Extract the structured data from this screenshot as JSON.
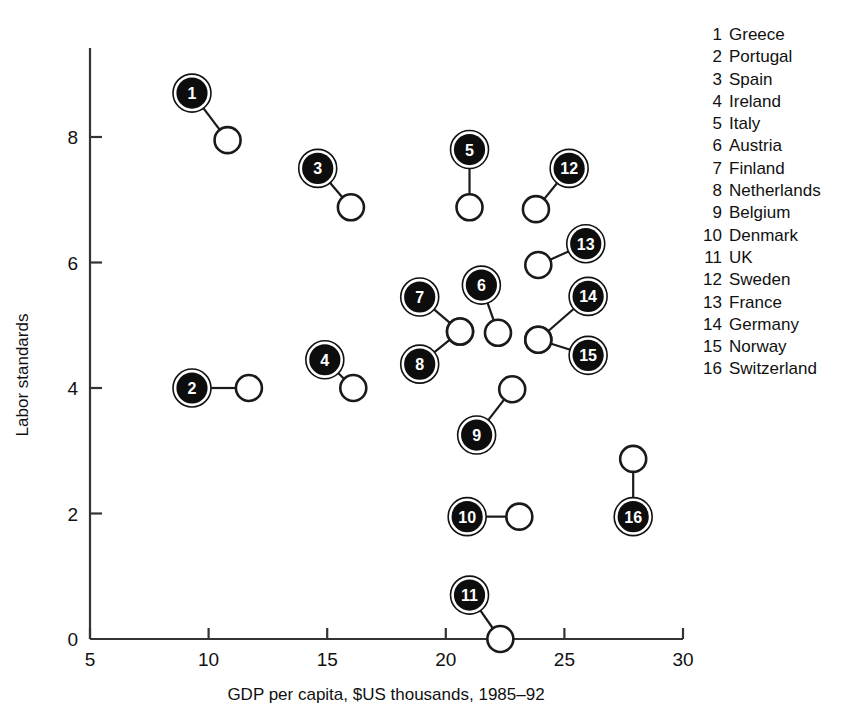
{
  "chart_data": {
    "type": "scatter",
    "title": "",
    "xlabel": "GDP per capita, $US thousands, 1985–92",
    "ylabel": "Labor standards",
    "xlim": [
      5,
      30
    ],
    "ylim": [
      0,
      9.4
    ],
    "xticks": [
      "5",
      "10",
      "15",
      "20",
      "25",
      "30"
    ],
    "yticks": [
      "0",
      "2",
      "4",
      "6",
      "8"
    ],
    "grid": false,
    "legend_position": "right",
    "marker_description": "filled numbered circle = first period value, open circle = second period value, joined by a line",
    "points": [
      {
        "id": 1,
        "label": "Greece",
        "x": 9.3,
        "y": 8.7,
        "x2": 10.8,
        "y2": 7.95
      },
      {
        "id": 2,
        "label": "Portugal",
        "x": 9.3,
        "y": 4.0,
        "x2": 11.7,
        "y2": 4.0
      },
      {
        "id": 3,
        "label": "Spain",
        "x": 14.6,
        "y": 7.5,
        "x2": 16.0,
        "y2": 6.88
      },
      {
        "id": 4,
        "label": "Ireland",
        "x": 14.9,
        "y": 4.45,
        "x2": 16.1,
        "y2": 4.0
      },
      {
        "id": 5,
        "label": "Italy",
        "x": 21.0,
        "y": 7.8,
        "x2": 21.0,
        "y2": 6.88
      },
      {
        "id": 6,
        "label": "Austria",
        "x": 21.5,
        "y": 5.64,
        "x2": 22.2,
        "y2": 4.88
      },
      {
        "id": 7,
        "label": "Finland",
        "x": 18.9,
        "y": 5.45,
        "x2": 20.6,
        "y2": 4.9
      },
      {
        "id": 8,
        "label": "Netherlands",
        "x": 18.9,
        "y": 4.38,
        "x2": 20.6,
        "y2": 4.9
      },
      {
        "id": 9,
        "label": "Belgium",
        "x": 21.3,
        "y": 3.25,
        "x2": 22.8,
        "y2": 3.98
      },
      {
        "id": 10,
        "label": "Denmark",
        "x": 20.9,
        "y": 1.95,
        "x2": 23.1,
        "y2": 1.95
      },
      {
        "id": 11,
        "label": "UK",
        "x": 21.0,
        "y": 0.7,
        "x2": 22.3,
        "y2": 0.0
      },
      {
        "id": 12,
        "label": "Sweden",
        "x": 25.2,
        "y": 7.5,
        "x2": 23.8,
        "y2": 6.85
      },
      {
        "id": 13,
        "label": "France",
        "x": 25.9,
        "y": 6.3,
        "x2": 23.9,
        "y2": 5.96
      },
      {
        "id": 14,
        "label": "Germany",
        "x": 26.0,
        "y": 5.46,
        "x2": 23.9,
        "y2": 4.77
      },
      {
        "id": 15,
        "label": "Norway",
        "x": 26.0,
        "y": 4.52,
        "x2": 23.9,
        "y2": 4.77
      },
      {
        "id": 16,
        "label": "Switzerland",
        "x": 27.9,
        "y": 1.95,
        "x2": 27.9,
        "y2": 2.87
      }
    ]
  },
  "legend": {
    "items": [
      {
        "num": "1",
        "name": "Greece"
      },
      {
        "num": "2",
        "name": "Portugal"
      },
      {
        "num": "3",
        "name": "Spain"
      },
      {
        "num": "4",
        "name": "Ireland"
      },
      {
        "num": "5",
        "name": "Italy"
      },
      {
        "num": "6",
        "name": "Austria"
      },
      {
        "num": "7",
        "name": "Finland"
      },
      {
        "num": "8",
        "name": "Netherlands"
      },
      {
        "num": "9",
        "name": "Belgium"
      },
      {
        "num": "10",
        "name": "Denmark"
      },
      {
        "num": "11",
        "name": "UK"
      },
      {
        "num": "12",
        "name": "Sweden"
      },
      {
        "num": "13",
        "name": "France"
      },
      {
        "num": "14",
        "name": "Germany"
      },
      {
        "num": "15",
        "name": "Norway"
      },
      {
        "num": "16",
        "name": "Switzerland"
      }
    ]
  },
  "colors": {
    "marker_fill": "#0d0d0d",
    "marker_text": "#ffffff",
    "axis": "#333333",
    "background": "#ffffff"
  }
}
